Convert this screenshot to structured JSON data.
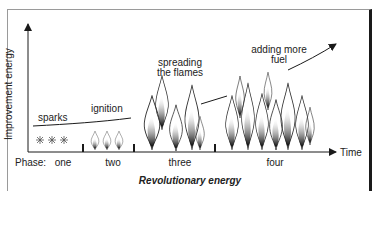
{
  "diagram": {
    "y_axis_label": "Improvement energy",
    "x_axis_label": "Time",
    "caption": "Revolutionary energy",
    "phase_label": "Phase:",
    "phases": [
      {
        "name": "one",
        "annotation": "sparks"
      },
      {
        "name": "two",
        "annotation": "ignition"
      },
      {
        "name": "three",
        "annotation_line1": "spreading",
        "annotation_line2": "the flames"
      },
      {
        "name": "four",
        "annotation_line1": "adding more",
        "annotation_line2": "fuel"
      }
    ],
    "icons": {
      "sparks": "spark-asterisk",
      "ignition": "small-flame",
      "spreading": "medium-flame",
      "fuel": "large-flame"
    }
  }
}
